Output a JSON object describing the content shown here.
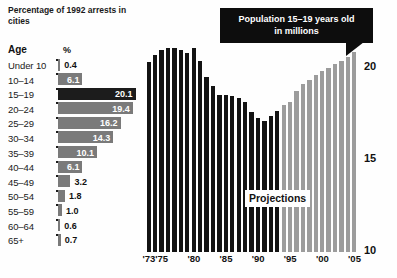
{
  "left_panel": {
    "title": "Percentage of 1992 arrests in cities",
    "col_age": "Age",
    "col_pct": "%",
    "rows": [
      {
        "age": "Under 10",
        "value": 0.4,
        "label": "0.4",
        "highlight": false,
        "label_inside": false
      },
      {
        "age": "10–14",
        "value": 6.1,
        "label": "6.1",
        "highlight": false,
        "label_inside": true
      },
      {
        "age": "15–19",
        "value": 20.1,
        "label": "20.1",
        "highlight": true,
        "label_inside": true
      },
      {
        "age": "20–24",
        "value": 19.4,
        "label": "19.4",
        "highlight": false,
        "label_inside": true
      },
      {
        "age": "25–29",
        "value": 16.2,
        "label": "16.2",
        "highlight": false,
        "label_inside": true
      },
      {
        "age": "30–34",
        "value": 14.3,
        "label": "14.3",
        "highlight": false,
        "label_inside": true
      },
      {
        "age": "35–39",
        "value": 10.1,
        "label": "10.1",
        "highlight": false,
        "label_inside": true
      },
      {
        "age": "40–44",
        "value": 6.1,
        "label": "6.1",
        "highlight": false,
        "label_inside": true
      },
      {
        "age": "45–49",
        "value": 3.2,
        "label": "3.2",
        "highlight": false,
        "label_inside": false
      },
      {
        "age": "50–54",
        "value": 1.8,
        "label": "1.8",
        "highlight": false,
        "label_inside": false
      },
      {
        "age": "55–59",
        "value": 1.0,
        "label": "1.0",
        "highlight": false,
        "label_inside": false
      },
      {
        "age": "60–64",
        "value": 0.6,
        "label": "0.6",
        "highlight": false,
        "label_inside": false
      },
      {
        "age": "65+",
        "value": 0.7,
        "label": "0.7",
        "highlight": false,
        "label_inside": false
      }
    ]
  },
  "right_panel": {
    "callout_line1": "Population 15–19 years old",
    "callout_line2": "in millions",
    "projections_label": "Projections",
    "x_ticks": [
      {
        "label": "'73",
        "year": 1973
      },
      {
        "label": "'75",
        "year": 1975
      },
      {
        "label": "'80",
        "year": 1980
      },
      {
        "label": "'85",
        "year": 1985
      },
      {
        "label": "'90",
        "year": 1990
      },
      {
        "label": "'95",
        "year": 1995
      },
      {
        "label": "'00",
        "year": 2000
      },
      {
        "label": "'05",
        "year": 2005
      }
    ],
    "y_ticks": [
      "20",
      "15",
      "10"
    ]
  },
  "colors": {
    "historical_bar": "#131313",
    "projection_bar": "#9c9c9c",
    "callout_bg": "#0d0d0d",
    "table_bar": "#7a7a7a",
    "table_bar_highlight": "#1c1c1c"
  },
  "chart_data": [
    {
      "type": "bar",
      "title": "Percentage of 1992 arrests in cities",
      "orientation": "horizontal",
      "xlabel": "%",
      "ylabel": "Age",
      "categories": [
        "Under 10",
        "10–14",
        "15–19",
        "20–24",
        "25–29",
        "30–34",
        "35–39",
        "40–44",
        "45–49",
        "50–54",
        "55–59",
        "60–64",
        "65+"
      ],
      "values": [
        0.4,
        6.1,
        20.1,
        19.4,
        16.2,
        14.3,
        10.1,
        6.1,
        3.2,
        1.8,
        1.0,
        0.6,
        0.7
      ],
      "xlim": [
        0,
        21
      ],
      "grid": false,
      "legend": "none",
      "highlight_category": "15–19",
      "data_labels": true
    },
    {
      "type": "bar",
      "title": "Population 15–19 years old in millions",
      "orientation": "vertical",
      "xlabel": "",
      "ylabel": "millions",
      "ylim": [
        10,
        21
      ],
      "y_tick_values": [
        10,
        15,
        20
      ],
      "grid": false,
      "legend": "none",
      "annotation": "Projections",
      "projection_start_year": 1994,
      "categories": [
        1973,
        1974,
        1975,
        1976,
        1977,
        1978,
        1979,
        1980,
        1981,
        1982,
        1983,
        1984,
        1985,
        1986,
        1987,
        1988,
        1989,
        1990,
        1991,
        1992,
        1993,
        1994,
        1995,
        1996,
        1997,
        1998,
        1999,
        2000,
        2001,
        2002,
        2003,
        2004,
        2005
      ],
      "values": [
        20.2,
        20.6,
        20.9,
        21.0,
        21.0,
        20.9,
        20.7,
        21.0,
        20.3,
        19.4,
        18.9,
        18.4,
        18.4,
        18.3,
        18.2,
        18.0,
        17.4,
        17.1,
        16.9,
        17.2,
        17.5,
        17.8,
        18.0,
        18.6,
        19.0,
        19.2,
        19.5,
        19.7,
        19.9,
        20.1,
        20.3,
        20.5,
        20.8
      ],
      "series_split": {
        "historical": {
          "name": "Historical",
          "years": [
            1973,
            1993
          ]
        },
        "projected": {
          "name": "Projections",
          "years": [
            1994,
            2005
          ]
        }
      }
    }
  ]
}
